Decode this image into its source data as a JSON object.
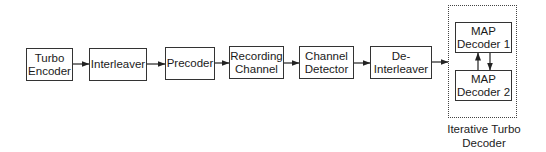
{
  "diagram": {
    "blocks": [
      {
        "id": "turbo-encoder",
        "label": "Turbo\nEncoder"
      },
      {
        "id": "interleaver",
        "label": "Interleaver"
      },
      {
        "id": "precoder",
        "label": "Precoder"
      },
      {
        "id": "recording-channel",
        "label": "Recording\nChannel"
      },
      {
        "id": "channel-detector",
        "label": "Channel\nDetector"
      },
      {
        "id": "de-interleaver",
        "label": "De-\nInterleaver"
      },
      {
        "id": "map-decoder-1",
        "label": "MAP\nDecoder 1"
      },
      {
        "id": "map-decoder-2",
        "label": "MAP\nDecoder 2"
      }
    ],
    "group": {
      "id": "iterative-turbo-decoder",
      "label": "Iterative Turbo\nDecoder",
      "style": "dashed"
    },
    "edges": [
      {
        "from": "turbo-encoder",
        "to": "interleaver"
      },
      {
        "from": "interleaver",
        "to": "precoder"
      },
      {
        "from": "precoder",
        "to": "recording-channel"
      },
      {
        "from": "recording-channel",
        "to": "channel-detector"
      },
      {
        "from": "channel-detector",
        "to": "de-interleaver"
      },
      {
        "from": "de-interleaver",
        "to": "iterative-turbo-decoder"
      },
      {
        "from": "map-decoder-2",
        "to": "map-decoder-1"
      },
      {
        "from": "map-decoder-1",
        "to": "map-decoder-2"
      }
    ],
    "colors": {
      "stroke": "#333333",
      "background": "#ffffff"
    }
  }
}
